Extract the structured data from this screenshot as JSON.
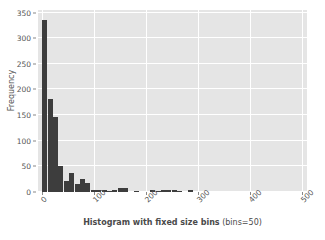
{
  "chart_data": {
    "type": "bar",
    "title": "",
    "subtitle": "",
    "xlabel_bold": "Histogram with fixed size bins",
    "xlabel_regular": "(bins=50)",
    "xlabel_full": "Histogram with fixed size bins (bins=50)",
    "ylabel": "Frequency",
    "xlim": [
      -8,
      510
    ],
    "ylim": [
      0,
      355
    ],
    "grid": true,
    "legend": false,
    "legend_position": "none",
    "bin_count": 50,
    "bin_width": 10.4,
    "bar_color": "#3d3d3d",
    "plot_background": "#e5e5e5",
    "grid_color": "#ffffff",
    "xticks": [
      0,
      100,
      200,
      300,
      400,
      500
    ],
    "xtick_labels": [
      "0",
      "100",
      "200",
      "300",
      "400",
      "500"
    ],
    "yticks": [
      0,
      50,
      100,
      150,
      200,
      250,
      300,
      350
    ],
    "ytick_labels": [
      "0",
      "50",
      "100",
      "150",
      "200",
      "250",
      "300",
      "350"
    ],
    "bin_starts": [
      0,
      10.4,
      20.8,
      31.2,
      41.6,
      52,
      62.4,
      72.8,
      83.2,
      93.6,
      104,
      114.4,
      124.8,
      135.2,
      145.6,
      156,
      166.4,
      176.8,
      187.2,
      197.6,
      208,
      218.4,
      228.8,
      239.2,
      249.6,
      260,
      270.4,
      280.8,
      291.2,
      301.6,
      312,
      322.4,
      332.8,
      343.2,
      353.6,
      364,
      374.4,
      384.8,
      395.2,
      405.6,
      416,
      426.4,
      436.8,
      447.2,
      457.6,
      468,
      478.4,
      488.8,
      499.2,
      509.6
    ],
    "values": [
      335,
      182,
      146,
      50,
      22,
      38,
      15,
      26,
      17,
      3,
      4,
      4,
      2,
      4,
      7,
      7,
      0,
      1,
      0,
      0,
      3,
      1,
      4,
      3,
      4,
      1,
      0,
      4,
      0,
      0,
      0,
      0,
      0,
      0,
      0,
      0,
      0,
      0,
      0,
      0,
      0,
      0,
      0,
      0,
      0,
      0,
      0,
      0,
      0,
      3
    ]
  }
}
